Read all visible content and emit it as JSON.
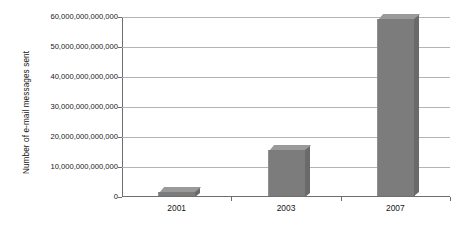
{
  "chart_data": {
    "type": "bar",
    "title": "",
    "subtitle": "",
    "xlabel": "",
    "ylabel": "Number of e-mail messages sent",
    "categories": [
      "2001",
      "2003",
      "2007"
    ],
    "values": [
      1500000000000,
      15500000000000,
      59000000000000
    ],
    "series": [
      {
        "name": "Number of e-mail messages sent",
        "values": [
          1500000000000,
          15500000000000,
          59000000000000
        ]
      }
    ],
    "ylim": [
      0,
      60000000000000
    ],
    "ytick_values": [
      0,
      10000000000000,
      20000000000000,
      30000000000000,
      40000000000000,
      50000000000000,
      60000000000000
    ],
    "ytick_labels": [
      "0",
      "10,000,000,000,000",
      "20,000,000,000,000",
      "30,000,000,000,000",
      "40,000,000,000,000",
      "50,000,000,000,000",
      "60,000,000,000,000"
    ],
    "grid": true,
    "legend": false,
    "legend_position": "none",
    "annotations": [],
    "style": "3d-bar-grayscale",
    "colors": {
      "background": "#ffffff",
      "bar_front": "#7c7c7c",
      "bar_top": "#9a9a9a",
      "bar_side": "#6a6a6a",
      "gridline": "#b4b4b4",
      "axis": "#6e6e6e",
      "text": "#161616"
    }
  }
}
